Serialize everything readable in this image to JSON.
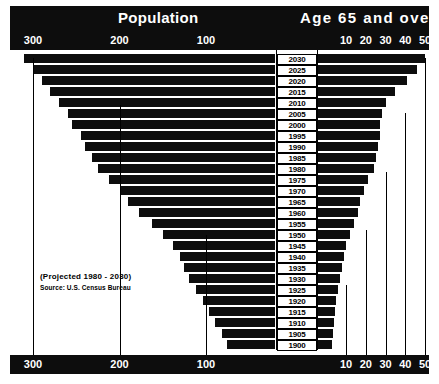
{
  "header": {
    "left_title": "Population",
    "right_title": "Age 65 and over"
  },
  "axes": {
    "left_ticks": [
      "300",
      "200",
      "100"
    ],
    "right_ticks": [
      "10",
      "20",
      "30",
      "40",
      "50"
    ],
    "left_ticks_bottom": [
      "300",
      "200",
      "100"
    ],
    "right_ticks_bottom": [
      "10",
      "20",
      "30",
      "40",
      "50"
    ]
  },
  "annotation": {
    "line1": "(Projected 1980 - 2030)",
    "line2": "Source: U.S. Census Bureau"
  },
  "colors": {
    "bar": "#0d0d0d",
    "background": "#ffffff",
    "header_bar": "#0d0d0d",
    "text_on_dark": "#ffffff"
  },
  "chart_data": {
    "type": "bar",
    "subtitle": "(Projected 1980 - 2030)",
    "annotation": "Source: U.S. Census Bureau",
    "orientation": "horizontal",
    "layout": "bidirectional population pyramid by year",
    "categories": [
      "2030",
      "2025",
      "2020",
      "2015",
      "2010",
      "2005",
      "2000",
      "1995",
      "1990",
      "1985",
      "1980",
      "1975",
      "1970",
      "1965",
      "1960",
      "1955",
      "1950",
      "1945",
      "1940",
      "1935",
      "1930",
      "1925",
      "1920",
      "1915",
      "1910",
      "1905",
      "1900"
    ],
    "xlabel_left": "Population",
    "xlabel_right": "Age 65 and over",
    "ylabel": "Year",
    "xlim_left": [
      0,
      320
    ],
    "xlim_right": [
      0,
      55
    ],
    "left_axis_units": "millions",
    "right_axis_units": "millions",
    "left_axis_direction": "right-to-left",
    "grid": true,
    "legend": "none",
    "series": [
      {
        "name": "Population",
        "side": "left",
        "values": [
          310,
          300,
          290,
          280,
          270,
          260,
          255,
          245,
          240,
          232,
          225,
          212,
          200,
          190,
          178,
          163,
          150,
          138,
          130,
          125,
          120,
          112,
          104,
          96,
          90,
          82,
          76
        ]
      },
      {
        "name": "Age 65 and over",
        "side": "right",
        "values": [
          50,
          46,
          41,
          35,
          30,
          28,
          27,
          27,
          26,
          25,
          24,
          21,
          19,
          17,
          16,
          14,
          12,
          10,
          9,
          8,
          7,
          6,
          5,
          4.5,
          4,
          3.5,
          3
        ]
      }
    ]
  }
}
